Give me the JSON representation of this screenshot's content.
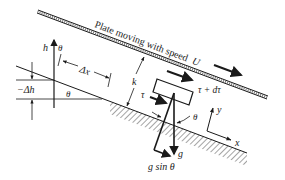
{
  "diagram": {
    "plate_label": "Plate moving with speed",
    "plate_speed_symbol": "U",
    "labels": {
      "h": "h",
      "theta_top": "θ",
      "delta_x": "Δx",
      "minus_delta_h": "−Δh",
      "theta_base": "θ",
      "k": "k",
      "tau": "τ",
      "tau_plus_dtau": "τ + dτ",
      "theta_block": "θ",
      "y_axis": "y",
      "x_axis": "x",
      "g": "g",
      "g_sin_theta": "g sin θ"
    },
    "colors": {
      "ink": "#1a1a1a",
      "background": "#ffffff"
    }
  }
}
